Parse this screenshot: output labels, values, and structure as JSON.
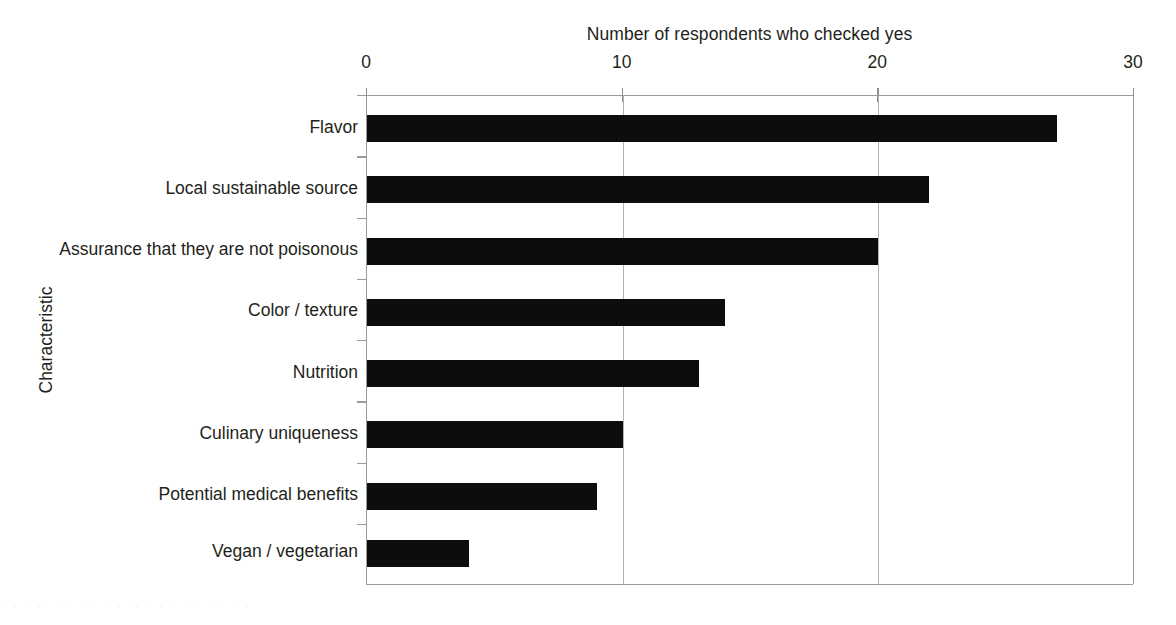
{
  "chart_data": {
    "type": "bar",
    "orientation": "horizontal",
    "title": "Number of respondents who checked yes",
    "xlabel": "Number of respondents who checked yes",
    "ylabel": "Characteristic",
    "categories": [
      "Flavor",
      "Local sustainable source",
      "Assurance that they are not poisonous",
      "Color / texture",
      "Nutrition",
      "Culinary uniqueness",
      "Potential medical benefits",
      "Vegan / vegetarian"
    ],
    "values": [
      27,
      22,
      20,
      14,
      13,
      10,
      9,
      4
    ],
    "xlim": [
      0,
      30
    ],
    "xticks": [
      0,
      10,
      20,
      30
    ],
    "xtick_labels": [
      "0",
      "10",
      "20",
      "30"
    ],
    "grid": "vertical-only",
    "legend": "none",
    "bar_color": "#0d0d0d",
    "grid_color": "#b2b2b2",
    "axis_color": "#9a9a9a",
    "background": "#ffffff",
    "title_position": "top-center",
    "xaxis_position": "top"
  },
  "artifact": {
    "bottom_text": "· ·  ·   ··  ·  ·   ·  ·    ·   ·  ··  ·   ·     ·    ·   ·  ·   ·    ·   ·"
  }
}
